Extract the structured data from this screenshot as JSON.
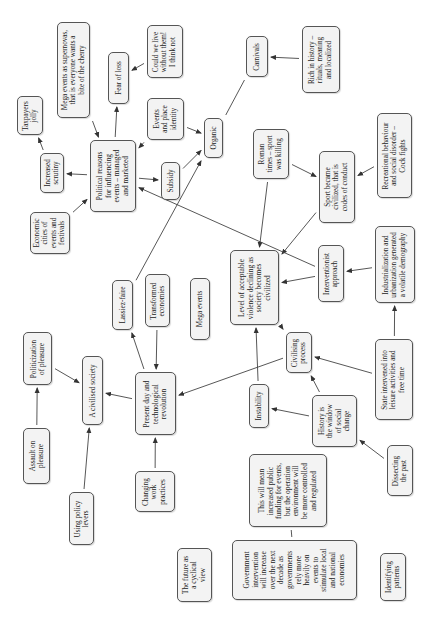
{
  "diagram": {
    "title": "",
    "orientation": "rotated-90-counterclockwise",
    "nodes": [
      {
        "id": "taxpayers-jolly",
        "text": "Taxpayers\njolly"
      },
      {
        "id": "increased-scrutiny",
        "text": "Increased\nscrutiny"
      },
      {
        "id": "mega-events-supernovas",
        "text": "Mega events as supernovas,\nthat is everyone wants a\nbite of the cherry"
      },
      {
        "id": "fear-of-loss",
        "text": "Fear of loss"
      },
      {
        "id": "could-we-live",
        "text": "Could we live\nwithout them!\nI think not"
      },
      {
        "id": "political-reasons",
        "text": "Political reasons\nfor influencing\nevents – managed\nand marketed"
      },
      {
        "id": "events-place-identity",
        "text": "Events\nand place\nidentity"
      },
      {
        "id": "subsidy",
        "text": "Subsidy"
      },
      {
        "id": "organic",
        "text": "Organic"
      },
      {
        "id": "economic-cities",
        "text": "Economic\ncities of\nevents and\nfestivals"
      },
      {
        "id": "carnivals",
        "text": "Carnivals"
      },
      {
        "id": "rich-in-history",
        "text": "Rich in history –\nrituals, meaning\nand localized"
      },
      {
        "id": "roman-times",
        "text": "Roman\ntimes – sport\nwas killing"
      },
      {
        "id": "sport-became-civilized",
        "text": "Sport became\ncivilized, that is\ncodes of conduct"
      },
      {
        "id": "recreational-behaviour",
        "text": "Recreational behaviour\nand social disorder –\nCock fights"
      },
      {
        "id": "lassiez-faire",
        "text": "Lassiez-faire"
      },
      {
        "id": "transformed-economies",
        "text": "Transformed\neconomies"
      },
      {
        "id": "mega-events",
        "text": "Mega events"
      },
      {
        "id": "level-of-acceptable-violence",
        "text": "Level of acceptable\nviolence declining as\nsociety becomes\ncivilized"
      },
      {
        "id": "interventionist-approach",
        "text": "Interventionist\napproach"
      },
      {
        "id": "industrialization",
        "text": "Industrialization and\nurbanization generated\na volatile demography"
      },
      {
        "id": "politicization-of-pleasure",
        "text": "Politicization\nof pleasure"
      },
      {
        "id": "a-civilised-society",
        "text": "A civilised society"
      },
      {
        "id": "present-day",
        "text": "Present day and\ntechnological\nrevolution"
      },
      {
        "id": "civilising-process",
        "text": "Civilising\nprocess"
      },
      {
        "id": "instability",
        "text": "Instability"
      },
      {
        "id": "history-window",
        "text": "History is\nthe window\nof social\nchange"
      },
      {
        "id": "state-intervened",
        "text": "State intervened into\nleisure activities and\nfree time"
      },
      {
        "id": "assault-on-pleasure",
        "text": "Assault on\npleasure"
      },
      {
        "id": "using-policy-levers",
        "text": "Using policy\nlevers"
      },
      {
        "id": "changing-work-practices",
        "text": "Changing\nwork\npractices"
      },
      {
        "id": "dissecting-the-past",
        "text": "Dissecting\nthe past"
      },
      {
        "id": "this-will-mean",
        "text": "This will mean\nincreased public\nfunding for events,\nbut the operation\nenvironment will\nbe more controlled\nand regulated"
      },
      {
        "id": "government-intervention",
        "text": "Government\nintervention\nwill increase\nover the next\ndecade as\ngovernments\nrely more\nheavily on\nevents to\nstimulate local\nand national\neconomies"
      },
      {
        "id": "future-cyclical",
        "text": "The future as\na cyclical\nview"
      },
      {
        "id": "identifying-patterns",
        "text": "Identifying\npatterns"
      }
    ],
    "edges": [
      {
        "from": "increased-scrutiny",
        "to": "taxpayers-jolly",
        "arrow": true
      },
      {
        "from": "political-reasons",
        "to": "increased-scrutiny",
        "arrow": true
      },
      {
        "from": "mega-events-supernovas",
        "to": "political-reasons",
        "arrow": true
      },
      {
        "from": "political-reasons",
        "to": "fear-of-loss",
        "arrow": true
      },
      {
        "from": "could-we-live",
        "to": "fear-of-loss",
        "arrow": true
      },
      {
        "from": "events-place-identity",
        "to": "political-reasons",
        "arrow": true
      },
      {
        "from": "political-reasons",
        "to": "subsidy",
        "arrow": true
      },
      {
        "from": "economic-cities",
        "to": "political-reasons",
        "arrow": true
      },
      {
        "from": "events-place-identity",
        "to": "organic",
        "arrow": true
      },
      {
        "from": "subsidy",
        "to": "organic",
        "arrow": true
      },
      {
        "from": "lassiez-faire",
        "to": "organic",
        "arrow": true
      },
      {
        "from": "organic",
        "to": "carnivals",
        "arrow": false
      },
      {
        "from": "rich-in-history",
        "to": "carnivals",
        "arrow": true
      },
      {
        "from": "roman-times",
        "to": "sport-became-civilized",
        "arrow": true
      },
      {
        "from": "roman-times",
        "to": "level-of-acceptable-violence",
        "arrow": true
      },
      {
        "from": "recreational-behaviour",
        "to": "sport-became-civilized",
        "arrow": true
      },
      {
        "from": "sport-became-civilized",
        "to": "level-of-acceptable-violence",
        "arrow": true
      },
      {
        "from": "interventionist-approach",
        "to": "political-reasons",
        "arrow": true
      },
      {
        "from": "interventionist-approach",
        "to": "level-of-acceptable-violence",
        "arrow": true
      },
      {
        "from": "industrialization",
        "to": "interventionist-approach",
        "arrow": true
      },
      {
        "from": "state-intervened",
        "to": "industrialization",
        "arrow": true
      },
      {
        "from": "state-intervened",
        "to": "civilising-process",
        "arrow": true
      },
      {
        "from": "level-of-acceptable-violence",
        "to": "civilising-process",
        "arrow": true
      },
      {
        "from": "instability",
        "to": "level-of-acceptable-violence",
        "arrow": true
      },
      {
        "from": "civilising-process",
        "to": "present-day",
        "arrow": true
      },
      {
        "from": "history-window",
        "to": "civilising-process",
        "arrow": true
      },
      {
        "from": "history-window",
        "to": "instability",
        "arrow": true
      },
      {
        "from": "dissecting-the-past",
        "to": "history-window",
        "arrow": true
      },
      {
        "from": "present-day",
        "to": "lassiez-faire",
        "arrow": true
      },
      {
        "from": "transformed-economies",
        "to": "present-day",
        "arrow": true
      },
      {
        "from": "present-day",
        "to": "a-civilised-society",
        "arrow": true
      },
      {
        "from": "changing-work-practices",
        "to": "present-day",
        "arrow": true
      },
      {
        "from": "politicization-of-pleasure",
        "to": "a-civilised-society",
        "arrow": true
      },
      {
        "from": "assault-on-pleasure",
        "to": "politicization-of-pleasure",
        "arrow": true
      },
      {
        "from": "using-policy-levers",
        "to": "a-civilised-society",
        "arrow": true
      },
      {
        "from": "this-will-mean",
        "to": "government-intervention",
        "arrow": false
      }
    ]
  }
}
